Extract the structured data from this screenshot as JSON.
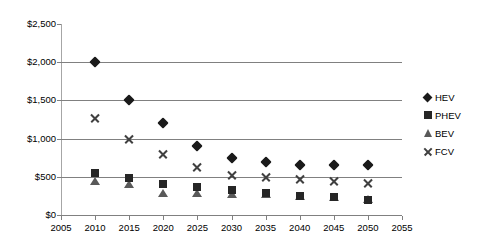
{
  "chart_data": {
    "type": "scatter",
    "title": "",
    "xlabel": "",
    "ylabel": "",
    "xlim": [
      2005,
      2055
    ],
    "ylim": [
      0,
      2500
    ],
    "grid": true,
    "legend_position": "right",
    "x": [
      2010,
      2015,
      2020,
      2025,
      2030,
      2035,
      2040,
      2045,
      2050
    ],
    "xticks": [
      "2005",
      "2010",
      "2015",
      "2020",
      "2025",
      "2030",
      "2035",
      "2040",
      "2045",
      "2050",
      "2055"
    ],
    "xtick_values": [
      2005,
      2010,
      2015,
      2020,
      2025,
      2030,
      2035,
      2040,
      2045,
      2050,
      2055
    ],
    "yticks": [
      "$0",
      "$500",
      "$1,000",
      "$1,500",
      "$2,000",
      "$2,500"
    ],
    "ytick_values": [
      0,
      500,
      1000,
      1500,
      2000,
      2500
    ],
    "gridlines": [
      500,
      1000,
      1500,
      2000
    ],
    "series": [
      {
        "name": "HEV",
        "marker": "diamond",
        "color": "#1a1a1a",
        "values": [
          2000,
          1500,
          1200,
          900,
          750,
          700,
          660,
          660,
          660
        ]
      },
      {
        "name": "PHEV",
        "marker": "square",
        "color": "#262626",
        "values": [
          550,
          480,
          400,
          370,
          330,
          290,
          255,
          230,
          200
        ]
      },
      {
        "name": "BEV",
        "marker": "triangle",
        "color": "#595959",
        "values": [
          450,
          400,
          290,
          290,
          270,
          270,
          250,
          240,
          210
        ]
      },
      {
        "name": "FCV",
        "marker": "cross",
        "color": "#404040",
        "values": [
          1275,
          1000,
          800,
          625,
          525,
          500,
          470,
          450,
          420
        ]
      }
    ]
  },
  "legend": {
    "items": [
      {
        "label": "HEV",
        "marker": "diamond"
      },
      {
        "label": "PHEV",
        "marker": "square"
      },
      {
        "label": "BEV",
        "marker": "triangle"
      },
      {
        "label": "FCV",
        "marker": "cross"
      }
    ]
  }
}
